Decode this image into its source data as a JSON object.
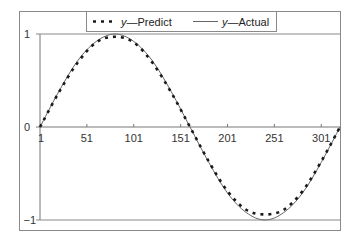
{
  "chart_data": {
    "type": "line",
    "title": "",
    "xlabel": "",
    "ylabel": "",
    "x_range": [
      1,
      321
    ],
    "ylim": [
      -1,
      1
    ],
    "x_ticks": [
      "1",
      "51",
      "101",
      "151",
      "201",
      "251",
      "301"
    ],
    "y_ticks": [
      "1",
      "0",
      "−1"
    ],
    "grid": false,
    "legend_position": "top-center",
    "series": [
      {
        "name": "y—Predict",
        "style": "dashed-dots",
        "x": [
          1,
          21,
          41,
          61,
          81,
          101,
          121,
          141,
          161,
          181,
          201,
          221,
          241,
          261,
          281,
          301,
          321
        ],
        "values": [
          0.0,
          0.37,
          0.69,
          0.91,
          0.97,
          0.91,
          0.69,
          0.37,
          0.0,
          -0.37,
          -0.69,
          -0.89,
          -0.94,
          -0.89,
          -0.69,
          -0.37,
          0.0
        ]
      },
      {
        "name": "y—Actual",
        "style": "solid",
        "x": [
          1,
          21,
          41,
          61,
          81,
          101,
          121,
          141,
          161,
          181,
          201,
          221,
          241,
          261,
          281,
          301,
          321
        ],
        "values": [
          0.0,
          0.38,
          0.71,
          0.92,
          1.0,
          0.92,
          0.71,
          0.38,
          0.0,
          -0.38,
          -0.71,
          -0.92,
          -1.0,
          -0.92,
          -0.71,
          -0.38,
          0.0
        ]
      }
    ]
  },
  "legend": {
    "predict": {
      "italic": "y",
      "rest": "—Predict"
    },
    "actual": {
      "italic": "y",
      "rest": "—Actual"
    }
  },
  "axis": {
    "y_top": "1",
    "y_zero": "0",
    "y_bottom": "−1",
    "x_labels": [
      "1",
      "51",
      "101",
      "151",
      "201",
      "251",
      "301"
    ]
  },
  "colors": {
    "frame": "#8a8a8a",
    "line": "#666666",
    "dots": "#1a1a1a"
  }
}
